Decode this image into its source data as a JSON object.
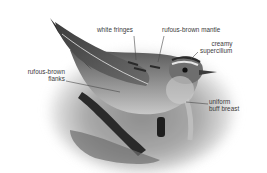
{
  "figure": {
    "style": "greyscale vignette photo with callout labels",
    "colors": {
      "background": "#ffffff",
      "label_text": "#3a3a3a",
      "leader_line": "#4a4a4a"
    }
  },
  "labels": {
    "white_fringes": "white fringes",
    "mantle": "rufous-brown mantle",
    "supercilium_line1": "creamy",
    "supercilium_line2": "supercilium",
    "flanks_line1": "rufous-brown",
    "flanks_line2": "flanks",
    "breast_line1": "uniform",
    "breast_line2": "buff breast"
  }
}
